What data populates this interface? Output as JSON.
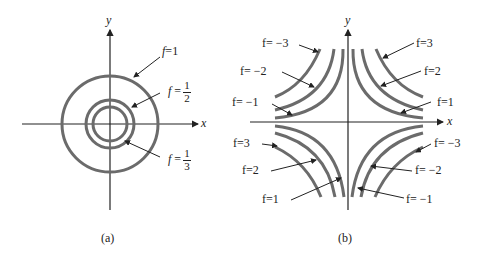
{
  "panel_a": {
    "caption": "(a)",
    "x_label": "x",
    "y_label": "y",
    "curves": [
      {
        "label_var": "f",
        "label_eq": "=",
        "label_value": "1"
      },
      {
        "label_var": "f",
        "label_eq": "=",
        "num": "1",
        "den": "2"
      },
      {
        "label_var": "f",
        "label_eq": "=",
        "num": "1",
        "den": "3"
      }
    ]
  },
  "panel_b": {
    "caption": "(b)",
    "x_label": "x",
    "y_label": "y",
    "labels": {
      "tl_3": "f= −3",
      "tl_2": "f= −2",
      "tl_1": "f= −1",
      "tr_3": "f=3",
      "tr_2": "f=2",
      "tr_1": "f=1",
      "bl_3": "f=3",
      "bl_2": "f=2",
      "bl_1": "f=1",
      "br_3": "f= −3",
      "br_2": "f= −2",
      "br_1": "f= −1"
    }
  },
  "colors": {
    "curve": "#6b6b6b",
    "axis": "#222222",
    "text": "#222222"
  }
}
